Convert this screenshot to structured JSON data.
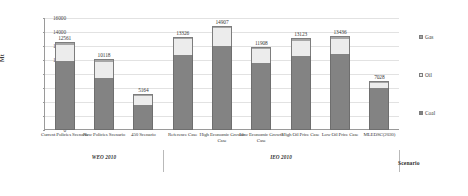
{
  "chart": {
    "ylabel": "Mt",
    "xlabel": "Scenario",
    "yticks": [
      "0",
      "2000",
      "4000",
      "6000",
      "8000",
      "10000",
      "12000",
      "14000",
      "16000"
    ]
  },
  "legend": {
    "position": "right",
    "items": [
      {
        "label": "Gas",
        "color": "#a6a6a6"
      },
      {
        "label": "Oil",
        "color": "#ececec"
      },
      {
        "label": "Coal",
        "color": "#838383"
      }
    ]
  },
  "groups": [
    {
      "label": "WEO 2010",
      "count": 3
    },
    {
      "label": "IEO 2010",
      "count": 6
    },
    {
      "label": "",
      "count": 1
    }
  ],
  "chart_data": {
    "type": "bar",
    "subtype": "stacked",
    "title": "",
    "xlabel": "Scenario",
    "ylabel": "Mt",
    "ylim": [
      0,
      16000
    ],
    "ytick_step": 2000,
    "grid": true,
    "legend_position": "right",
    "categories": [
      "Current Policies Scenario",
      "New Policies Scenario",
      "450 Scenario",
      "Reference Case",
      "High Economic Growth Case",
      "Low Economic Growth Case",
      "High Oil Price Case",
      "Low Oil Price Case",
      "MLEDSC(2030)"
    ],
    "group_bands": [
      "WEO 2010",
      "WEO 2010",
      "WEO 2010",
      "IEO 2010",
      "IEO 2010",
      "IEO 2010",
      "IEO 2010",
      "IEO 2010",
      ""
    ],
    "totals": [
      12561,
      10118,
      5164,
      13326,
      14907,
      11908,
      13123,
      13436,
      7028
    ],
    "series": [
      {
        "name": "Coal",
        "color": "#838383",
        "values": [
          9800,
          7410,
          3560,
          10730,
          11980,
          9620,
          10560,
          10810,
          6000
        ]
      },
      {
        "name": "Oil",
        "color": "#ececec",
        "values": [
          2380,
          2240,
          1300,
          2230,
          2540,
          1970,
          2180,
          2220,
          700
        ]
      },
      {
        "name": "Gas",
        "color": "#a6a6a6",
        "values": [
          381,
          468,
          304,
          366,
          387,
          318,
          383,
          406,
          328
        ]
      }
    ],
    "data_labels": [
      "12561",
      "10118",
      "5164",
      "13326",
      "14907",
      "11908",
      "13123",
      "13436",
      "7028"
    ]
  }
}
